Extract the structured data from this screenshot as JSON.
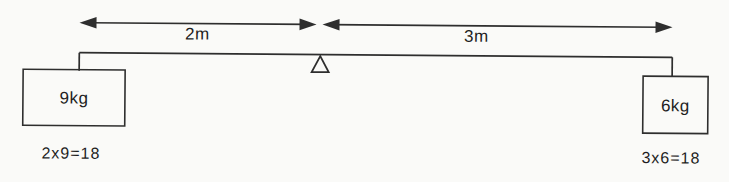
{
  "diagram": {
    "distances": {
      "left_label": "2m",
      "right_label": "3m"
    },
    "weights": {
      "left_label": "9kg",
      "right_label": "6kg"
    },
    "equations": {
      "left": "2x9=18",
      "right": "3x6=18"
    },
    "icons": {
      "fulcrum": "open-triangle-fulcrum",
      "dimension_arrows": "double-headed-arrows-meeting-at-pivot"
    },
    "colors": {
      "line": "#2e2e2e",
      "text": "#1e1e1e",
      "background": "#fafaf8"
    }
  }
}
